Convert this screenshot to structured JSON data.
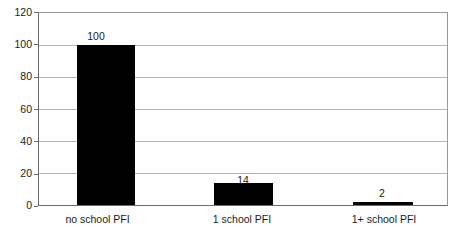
{
  "chart_data": {
    "type": "bar",
    "title": "",
    "subtitle": "",
    "xlabel": "",
    "ylabel": "",
    "categories": [
      "no school PFI",
      "1 school PFI",
      "1+ school PFI"
    ],
    "values": [
      100,
      14,
      2
    ],
    "value_labels": [
      "100",
      "14",
      "2"
    ],
    "series": [
      {
        "name": "",
        "values": [
          100,
          14,
          2
        ]
      }
    ],
    "ylim": [
      0,
      120
    ],
    "ytick_labels": [
      "0",
      "20",
      "40",
      "60",
      "80",
      "100",
      "120"
    ],
    "ytick_values": [
      0,
      20,
      40,
      60,
      80,
      100,
      120
    ],
    "grid": true,
    "grid_axis": "y",
    "legend": false,
    "legend_position": "none",
    "bar_color": "#000000",
    "grid_color": "#b5b5b5",
    "axis_color": "#6b6b6b",
    "background_color": "#ffffff",
    "text_color": "#1c1c1c"
  }
}
